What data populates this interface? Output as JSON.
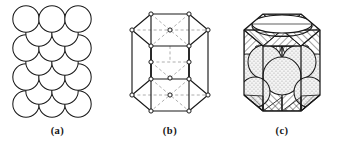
{
  "figure": {
    "background_color": "#ffffff",
    "line_color": "#1a1a1a",
    "dashed_line_color": "#8a8a8a",
    "sphere_fill": "#ffffff",
    "stipple_fill": "#d8d8d8",
    "hatch_color": "#2a2a2a",
    "panels": [
      {
        "id": "a",
        "caption": "(a)",
        "description": "hard-sphere unit cell representation",
        "sphere_count": 17,
        "sphere_radius_px": 13.2,
        "rows": [
          {
            "label": "top-back-row",
            "y": 18,
            "xs": [
              26,
              52,
              78
            ]
          },
          {
            "label": "upper-mid-row",
            "y": 32,
            "xs": [
              39,
              65
            ]
          },
          {
            "label": "mid-row",
            "y": 47,
            "xs": [
              26,
              52,
              78
            ]
          },
          {
            "label": "center-row",
            "y": 62,
            "xs": [
              39,
              65
            ]
          },
          {
            "label": "lower-mid-row",
            "y": 76,
            "xs": [
              26,
              52,
              78
            ]
          },
          {
            "label": "bottom-front-row",
            "y": 92,
            "xs": [
              39,
              65
            ]
          },
          {
            "label": "bottom-row",
            "y": 104,
            "xs": [
              26,
              52,
              78
            ]
          }
        ]
      },
      {
        "id": "b",
        "caption": "(b)",
        "description": "reduced-sphere wireframe hexagonal prism unit cell with lattice points",
        "top_face_vertices": 6,
        "bottom_face_vertices": 6,
        "face_center_points": 2,
        "midplane_interior_points": 3,
        "vertex_marker": "open-circle",
        "solid_edges": "prism edges",
        "dashed_edges": "hidden diagonals and midplane guides"
      },
      {
        "id": "c",
        "caption": "(c)",
        "description": "cutaway hexagonal prism showing packed spheres with cross-hatched solid regions",
        "hatch_pattern": "diagonal-line-hatch",
        "top_face_pattern": "striped-ellipse",
        "sphere_shading": "stippled"
      }
    ]
  }
}
